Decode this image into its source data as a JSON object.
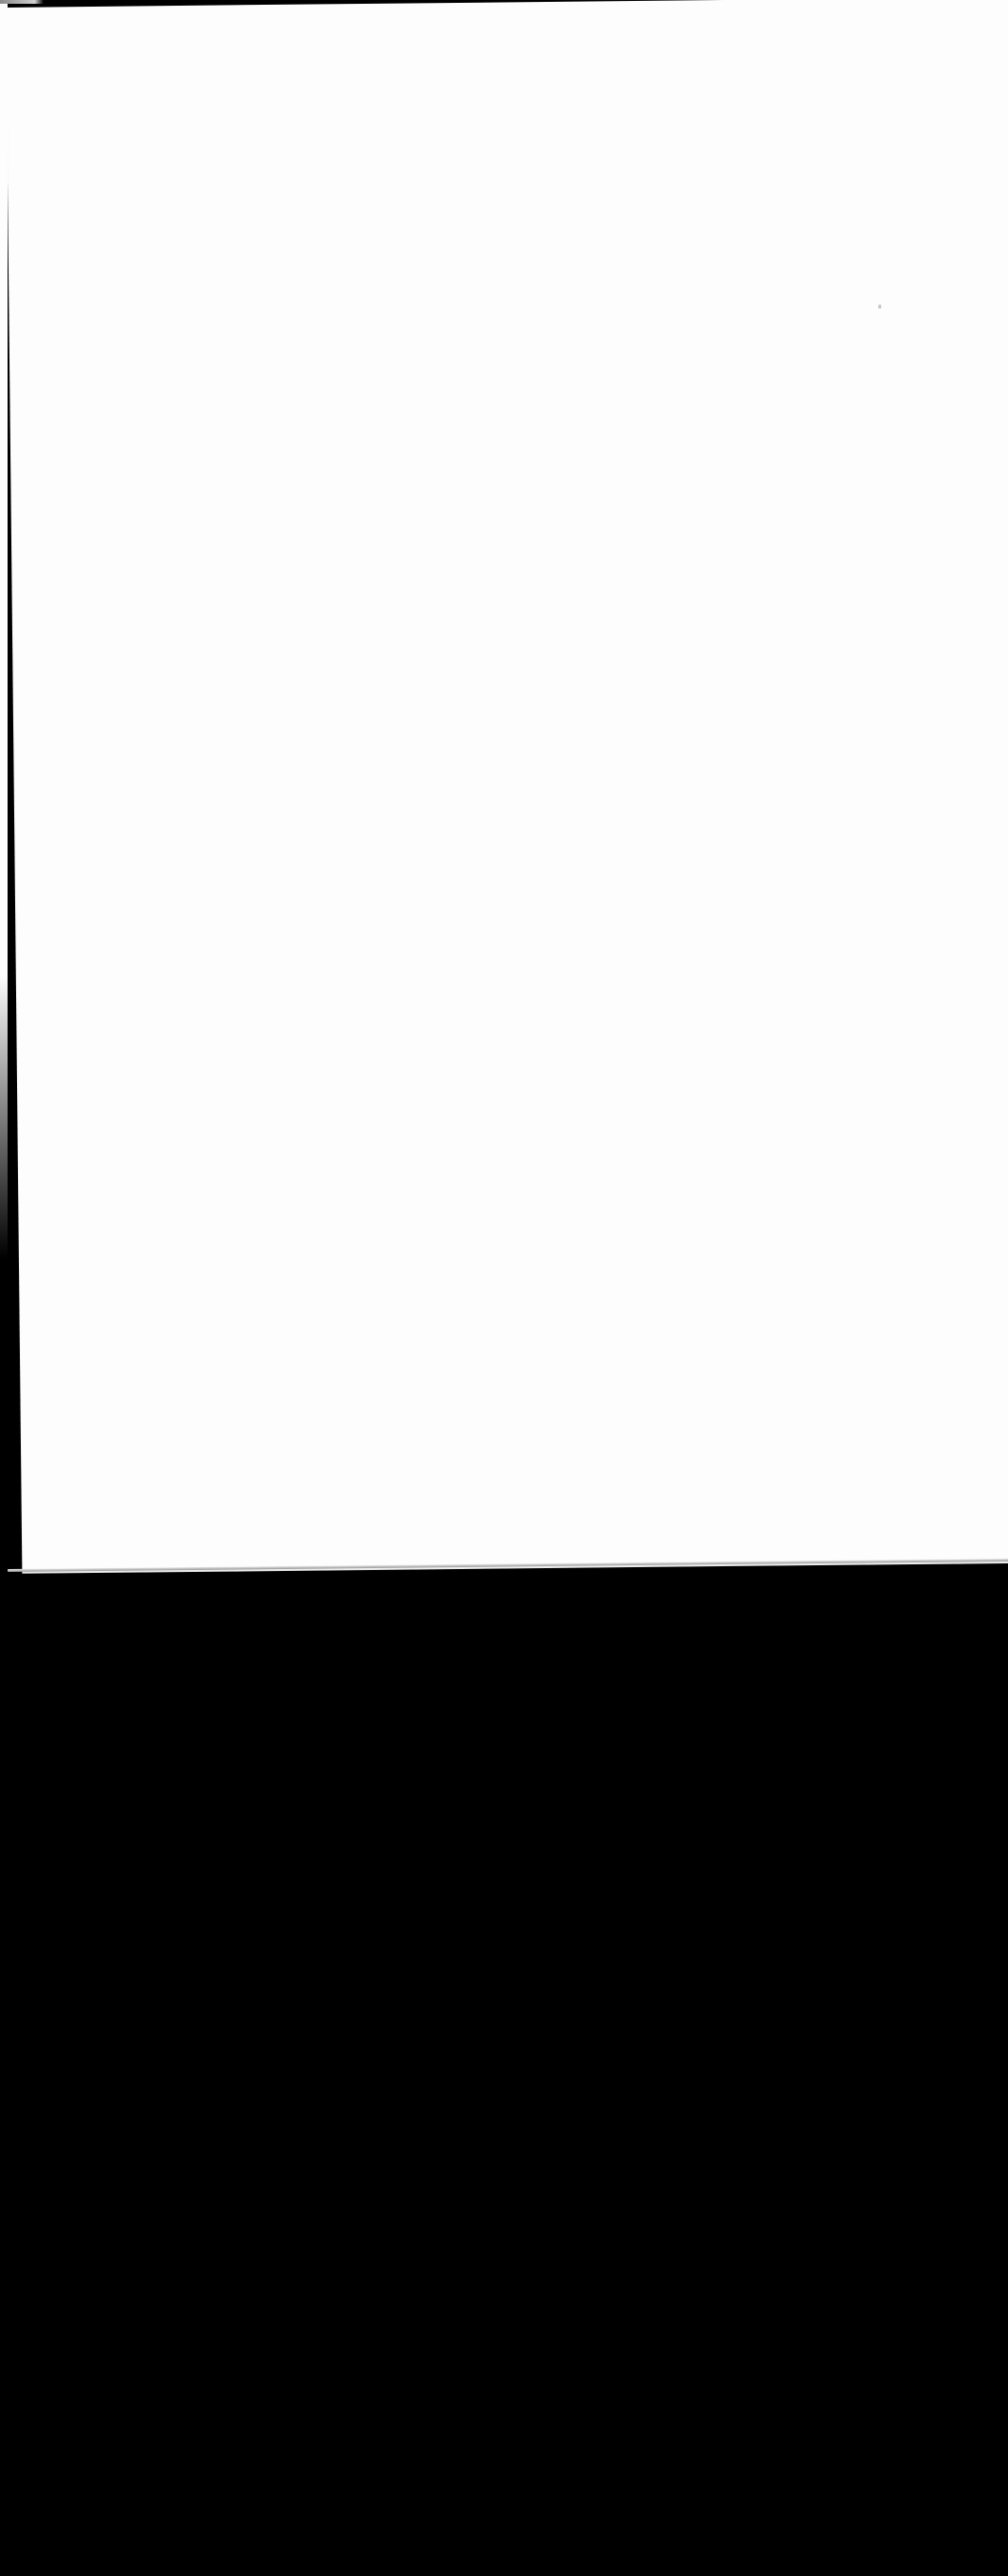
{
  "document": {
    "type": "scanned-page",
    "visible_text": "",
    "page_color": "#fdfdfd",
    "background_color": "#000000"
  },
  "layout": {
    "page_region": {
      "top": 0,
      "bottom_left": 1660,
      "bottom_right": 1648
    },
    "backdrop_region": {
      "top": 1660,
      "bottom": 2722
    }
  }
}
